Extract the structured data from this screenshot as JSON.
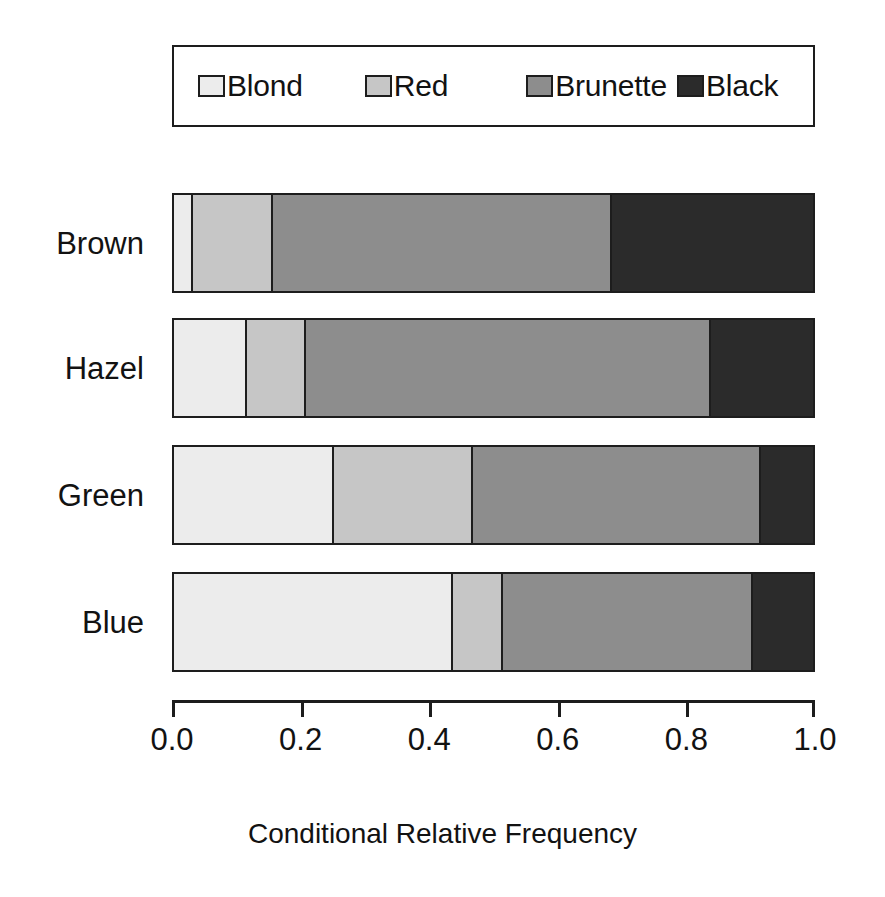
{
  "chart_data": {
    "type": "bar",
    "orientation": "horizontal",
    "stacked": true,
    "normalized": true,
    "title": "",
    "xlabel": "Conditional Relative Frequency",
    "ylabel": "",
    "xlim": [
      0.0,
      1.0
    ],
    "grid": false,
    "legend_position": "top",
    "categories": [
      "Brown",
      "Hazel",
      "Green",
      "Blue"
    ],
    "tick_values": [
      0.0,
      0.2,
      0.4,
      0.6,
      0.8,
      1.0
    ],
    "tick_labels": [
      "0.0",
      "0.2",
      "0.4",
      "0.6",
      "0.8",
      "1.0"
    ],
    "series": [
      {
        "name": "Blond",
        "color": "#ececec",
        "values": [
          0.03,
          0.114,
          0.25,
          0.437
        ]
      },
      {
        "name": "Red",
        "color": "#c6c6c6",
        "values": [
          0.125,
          0.093,
          0.218,
          0.078
        ]
      },
      {
        "name": "Brunette",
        "color": "#8d8d8d",
        "values": [
          0.53,
          0.634,
          0.451,
          0.391
        ]
      },
      {
        "name": "Black",
        "color": "#2b2b2b",
        "values": [
          0.315,
          0.159,
          0.081,
          0.094
        ]
      }
    ],
    "cumulative_boundaries": [
      [
        0.03,
        0.155,
        0.685,
        1.0
      ],
      [
        0.114,
        0.207,
        0.841,
        1.0
      ],
      [
        0.25,
        0.468,
        0.919,
        1.0
      ],
      [
        0.437,
        0.515,
        0.906,
        1.0
      ]
    ]
  },
  "legend": {
    "entries": [
      {
        "label": "Blond",
        "color": "#ececec"
      },
      {
        "label": "Red",
        "color": "#c6c6c6"
      },
      {
        "label": "Brunette",
        "color": "#8d8d8d"
      },
      {
        "label": "Black",
        "color": "#2b2b2b"
      }
    ]
  },
  "axis": {
    "title": "Conditional Relative Frequency",
    "ticks": [
      "0.0",
      "0.2",
      "0.4",
      "0.6",
      "0.8",
      "1.0"
    ]
  },
  "categories": {
    "labels": [
      "Brown",
      "Hazel",
      "Green",
      "Blue"
    ]
  },
  "colors": {
    "blond": "#ececec",
    "red": "#c6c6c6",
    "brunette": "#8d8d8d",
    "black": "#2b2b2b",
    "outline": "#1d1d1d",
    "background": "#ffffff",
    "text": "#121212"
  }
}
